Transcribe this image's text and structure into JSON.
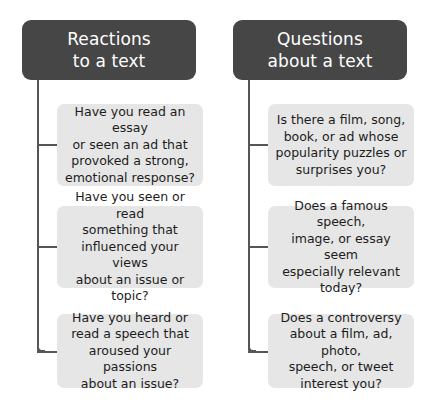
{
  "diagram": {
    "background_color": "#ffffff",
    "header_color": "#464646",
    "header_text_color": "#ffffff",
    "leaf_color": "#e6e6e6",
    "leaf_text_color": "#1c1c1c",
    "connector_color": "#555555",
    "columns": [
      {
        "header": "Reactions\nto a text",
        "leaves": [
          "Have you read an essay\nor seen an ad that\nprovoked a strong,\nemotional response?",
          "Have you seen or read\nsomething that\ninfluenced your views\nabout an issue or\ntopic?",
          "Have you heard or\nread a speech that\naroused your passions\nabout an issue?"
        ]
      },
      {
        "header": "Questions\nabout a text",
        "leaves": [
          "Is there a film, song,\nbook, or ad whose\npopularity puzzles or\nsurprises you?",
          "Does a famous speech,\nimage, or essay seem\nespecially relevant\ntoday?",
          "Does a controversy\nabout a film, ad, photo,\nspeech, or tweet\ninterest you?"
        ]
      }
    ]
  }
}
